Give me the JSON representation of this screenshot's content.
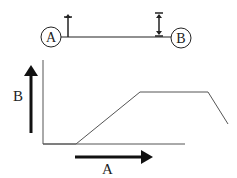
{
  "diagram": {
    "top": {
      "node_a": {
        "label": "A"
      },
      "node_b": {
        "label": "B"
      },
      "connector": "horizontal-line",
      "arrow_a": "up-arrow",
      "arrow_b": "double-headed-vertical-arrow"
    },
    "graph": {
      "y_label": "B",
      "x_label": "A",
      "curve_shape": "flat-ramp-plateau-drop"
    }
  },
  "colors": {
    "stroke": "#222222",
    "curve": "#555555",
    "background": "#ffffff"
  }
}
